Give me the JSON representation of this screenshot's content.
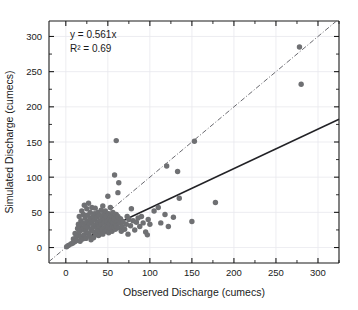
{
  "chart_data": {
    "type": "scatter",
    "title": "",
    "xlabel": "Observed Discharge (cumecs)",
    "ylabel": "Simulated Discharge (cumecs)",
    "xlim": [
      -20,
      325
    ],
    "ylim": [
      -22,
      322
    ],
    "xticks": [
      0,
      50,
      100,
      150,
      200,
      250,
      300
    ],
    "yticks": [
      0,
      50,
      100,
      150,
      200,
      250,
      300
    ],
    "xtick_labels": [
      "0",
      "50",
      "100",
      "150",
      "200",
      "250",
      "300"
    ],
    "ytick_labels": [
      "0",
      "50",
      "100",
      "150",
      "200",
      "250",
      "300"
    ],
    "minor_tick_step": 25,
    "grid": true,
    "legend": "none",
    "annotations": [
      {
        "id": "equation",
        "text": "y = 0.561x"
      },
      {
        "id": "r-squared",
        "text": "R² = 0.69"
      }
    ],
    "series": [
      {
        "name": "Observed vs Simulated Discharge",
        "marker": "circle",
        "marker_color": "#6f7073",
        "marker_size": 4.2,
        "points": [
          [
            1,
            1
          ],
          [
            3,
            3
          ],
          [
            6,
            5
          ],
          [
            8,
            6
          ],
          [
            9,
            12
          ],
          [
            10,
            8
          ],
          [
            11,
            20
          ],
          [
            12,
            14
          ],
          [
            13,
            10
          ],
          [
            14,
            27
          ],
          [
            15,
            33
          ],
          [
            15,
            17
          ],
          [
            16,
            44
          ],
          [
            16,
            22
          ],
          [
            17,
            9
          ],
          [
            17,
            30
          ],
          [
            18,
            38
          ],
          [
            18,
            15
          ],
          [
            19,
            25
          ],
          [
            19,
            52
          ],
          [
            20,
            12
          ],
          [
            20,
            35
          ],
          [
            21,
            47
          ],
          [
            21,
            28
          ],
          [
            22,
            18
          ],
          [
            22,
            60
          ],
          [
            23,
            31
          ],
          [
            23,
            42
          ],
          [
            24,
            24
          ],
          [
            24,
            13
          ],
          [
            25,
            55
          ],
          [
            25,
            37
          ],
          [
            26,
            29
          ],
          [
            26,
            46
          ],
          [
            27,
            20
          ],
          [
            27,
            63
          ],
          [
            28,
            34
          ],
          [
            28,
            16
          ],
          [
            29,
            41
          ],
          [
            29,
            50
          ],
          [
            30,
            26
          ],
          [
            30,
            11
          ],
          [
            31,
            57
          ],
          [
            31,
            36
          ],
          [
            32,
            23
          ],
          [
            32,
            44
          ],
          [
            33,
            30
          ],
          [
            33,
            14
          ],
          [
            34,
            48
          ],
          [
            34,
            39
          ],
          [
            35,
            21
          ],
          [
            35,
            56
          ],
          [
            36,
            32
          ],
          [
            36,
            18
          ],
          [
            37,
            43
          ],
          [
            37,
            27
          ],
          [
            38,
            50
          ],
          [
            38,
            36
          ],
          [
            39,
            24
          ],
          [
            39,
            17
          ],
          [
            40,
            46
          ],
          [
            40,
            30
          ],
          [
            41,
            38
          ],
          [
            41,
            22
          ],
          [
            42,
            53
          ],
          [
            42,
            33
          ],
          [
            43,
            26
          ],
          [
            43,
            42
          ],
          [
            44,
            19
          ],
          [
            44,
            59
          ],
          [
            45,
            35
          ],
          [
            45,
            47
          ],
          [
            46,
            28
          ],
          [
            46,
            40
          ],
          [
            47,
            23
          ],
          [
            47,
            52
          ],
          [
            48,
            31
          ],
          [
            48,
            44
          ],
          [
            49,
            25
          ],
          [
            49,
            37
          ],
          [
            50,
            73
          ],
          [
            50,
            29
          ],
          [
            51,
            48
          ],
          [
            51,
            21
          ],
          [
            52,
            41
          ],
          [
            52,
            34
          ],
          [
            53,
            57
          ],
          [
            53,
            27
          ],
          [
            54,
            45
          ],
          [
            54,
            38
          ],
          [
            55,
            30
          ],
          [
            55,
            23
          ],
          [
            56,
            50
          ],
          [
            56,
            36
          ],
          [
            57,
            43
          ],
          [
            57,
            29
          ],
          [
            58,
            103
          ],
          [
            58,
            40
          ],
          [
            59,
            33
          ],
          [
            59,
            26
          ],
          [
            60,
            152
          ],
          [
            60,
            47
          ],
          [
            60,
            31
          ],
          [
            61,
            38
          ],
          [
            62,
            78
          ],
          [
            62,
            44
          ],
          [
            63,
            92
          ],
          [
            63,
            28
          ],
          [
            64,
            35
          ],
          [
            65,
            41
          ],
          [
            66,
            23
          ],
          [
            67,
            30
          ],
          [
            68,
            37
          ],
          [
            70,
            26
          ],
          [
            72,
            33
          ],
          [
            73,
            44
          ],
          [
            74,
            19
          ],
          [
            75,
            40
          ],
          [
            77,
            31
          ],
          [
            78,
            55
          ],
          [
            80,
            38
          ],
          [
            82,
            25
          ],
          [
            84,
            36
          ],
          [
            86,
            42
          ],
          [
            88,
            30
          ],
          [
            90,
            44
          ],
          [
            92,
            35
          ],
          [
            95,
            22
          ],
          [
            97,
            18
          ],
          [
            98,
            40
          ],
          [
            100,
            33
          ],
          [
            105,
            52
          ],
          [
            110,
            57
          ],
          [
            113,
            35
          ],
          [
            118,
            47
          ],
          [
            120,
            116
          ],
          [
            122,
            30
          ],
          [
            128,
            43
          ],
          [
            133,
            108
          ],
          [
            135,
            70
          ],
          [
            150,
            37
          ],
          [
            153,
            151
          ],
          [
            178,
            64
          ],
          [
            278,
            285
          ],
          [
            280,
            232
          ]
        ]
      }
    ],
    "lines": [
      {
        "name": "regression-fit",
        "style": "solid",
        "color": "#222226",
        "slope": 0.561,
        "intercept": 0,
        "x_start": 0,
        "x_end": 340
      },
      {
        "name": "one-to-one-line",
        "style": "dash-dot",
        "color": "#6a6a70",
        "slope": 1,
        "intercept": 0,
        "x_start": -20,
        "x_end": 322
      }
    ]
  },
  "axes": {
    "x_title": "Observed Discharge (cumecs)",
    "y_title": "Simulated Discharge (cumecs)"
  },
  "annotation": {
    "equation": "y = 0.561x",
    "r_squared": "R² = 0.69"
  }
}
